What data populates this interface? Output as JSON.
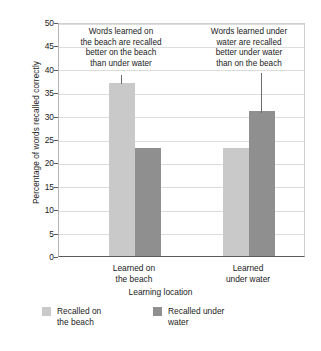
{
  "chart_data": {
    "type": "bar",
    "title": "",
    "xlabel": "Learning location",
    "ylabel": "Percentage of words recalled correctly",
    "categories": [
      "Learned on the beach",
      "Learned under water"
    ],
    "category_lines": [
      [
        "Learned on",
        "the beach"
      ],
      [
        "Learned",
        "under water"
      ]
    ],
    "series": [
      {
        "name": "Recalled on the beach",
        "color": "#c9c9c9",
        "values": [
          37,
          23
        ]
      },
      {
        "name": "Recalled under water",
        "color": "#8f8f8f",
        "values": [
          23,
          31
        ]
      }
    ],
    "ylim": [
      0,
      50
    ],
    "yticks": [
      0,
      5,
      10,
      15,
      20,
      25,
      30,
      35,
      40,
      45,
      50
    ],
    "grid": true,
    "legend_position": "bottom-left",
    "annotations": [
      {
        "id": "annotation-beach",
        "lines": [
          "Words learned on",
          "the beach are recalled",
          "better on the beach",
          "than under water"
        ],
        "target_series": "Recalled on the beach",
        "target_category": "Learned on the beach"
      },
      {
        "id": "annotation-water",
        "lines": [
          "Words learned under",
          "water are recalled",
          "better under water",
          "than on the beach"
        ],
        "target_series": "Recalled under water",
        "target_category": "Learned under water"
      }
    ]
  },
  "legend": {
    "items": [
      {
        "label_lines": [
          "Recalled on",
          "the beach"
        ],
        "swatch": "light"
      },
      {
        "label_lines": [
          "Recalled under",
          "water"
        ],
        "swatch": "dark"
      }
    ]
  },
  "axis": {
    "y_title": "Percentage of words recalled correctly",
    "x_title": "Learning location"
  }
}
